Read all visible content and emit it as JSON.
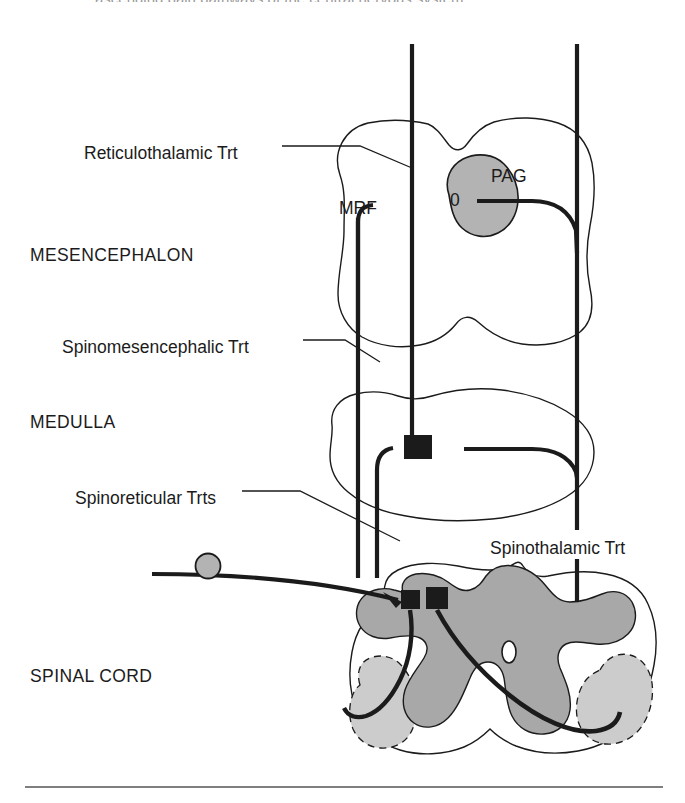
{
  "figure": {
    "title_cropped": "ascending pain pathways of the central nervous system",
    "background_color": "#ffffff",
    "ink_color": "#1b1b1b",
    "gray_matter_color": "#a8a8a8",
    "light_gray_color": "#cccccc",
    "pag_fill_color": "#b3b3b3"
  },
  "regions": [
    {
      "id": "mesencephalon",
      "label": "MESENCEPHALON",
      "x": 30,
      "y": 245
    },
    {
      "id": "medulla",
      "label": "MEDULLA",
      "x": 30,
      "y": 412
    },
    {
      "id": "spinal_cord",
      "label": "SPINAL CORD",
      "x": 30,
      "y": 666
    }
  ],
  "tract_labels": [
    {
      "id": "reticulothalamic",
      "label": "Reticulothalamic Trt",
      "x": 84,
      "y": 143
    },
    {
      "id": "spinomesencephalic",
      "label": "Spinomesencephalic Trt",
      "x": 62,
      "y": 337
    },
    {
      "id": "spinoreticular",
      "label": "Spinoreticular Trts",
      "x": 75,
      "y": 488
    },
    {
      "id": "spinothalamic",
      "label": "Spinothalamic Trt",
      "x": 487,
      "y": 538
    }
  ],
  "structure_labels": [
    {
      "id": "mrf",
      "label": "MRF",
      "x": 339,
      "y": 198
    },
    {
      "id": "pag",
      "label": "PAG",
      "x": 491,
      "y": 166
    },
    {
      "id": "pag_aqueduct",
      "label": "0",
      "x": 456,
      "y": 201
    },
    {
      "id": "central_canal",
      "label": "0",
      "x": 506,
      "y": 648
    }
  ],
  "markers": {
    "synapse_squares": [
      {
        "id": "medulla-synapse",
        "x": 404,
        "y": 435,
        "w": 28,
        "h": 24
      },
      {
        "id": "spinal-synapse-left",
        "x": 401,
        "y": 590,
        "w": 19,
        "h": 19
      },
      {
        "id": "spinal-synapse-right",
        "x": 426,
        "y": 587,
        "w": 22,
        "h": 22
      }
    ],
    "dorsal_root_ganglion": {
      "id": "drg",
      "cx": 208,
      "cy": 566,
      "r": 12
    }
  },
  "vertical_tracts": [
    {
      "id": "reticulothalamic-line",
      "x": 412,
      "y1": 44,
      "y2": 442
    },
    {
      "id": "spinothalamic-line-upper",
      "x": 577,
      "y1": 44,
      "y2": 218
    },
    {
      "id": "spinothalamic-line-mid",
      "x": 577,
      "y1": 218,
      "y2": 530
    },
    {
      "id": "spinothalamic-line-lower",
      "x": 577,
      "y1": 553,
      "y2": 600
    },
    {
      "id": "spinomesencephalic-line",
      "x": 358,
      "y1": 218,
      "y2": 578
    },
    {
      "id": "spinoreticular-line",
      "x": 377,
      "y1": 448,
      "y2": 578
    }
  ],
  "rule": {
    "id": "bottom-rule",
    "x1": 25,
    "x2": 663,
    "y": 787
  }
}
